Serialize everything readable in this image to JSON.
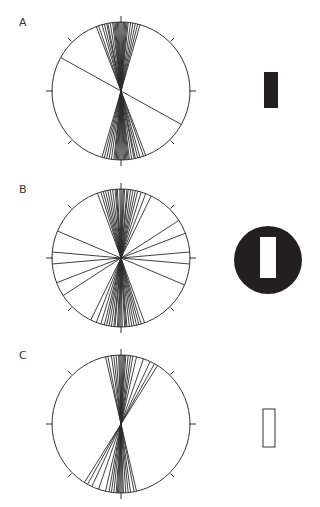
{
  "panels": [
    {
      "id": "A",
      "label": "A",
      "label_pos": [
        19,
        16
      ],
      "circle": {
        "cx": 121,
        "cy": 91,
        "r": 69
      },
      "line_angles_deg": [
        -21,
        -19,
        -16,
        -14,
        -12,
        -11,
        -9,
        -7,
        -6,
        -5,
        -4,
        -3,
        -2,
        -1,
        0,
        1,
        2,
        3,
        4,
        5,
        6,
        8,
        10,
        12,
        14,
        16,
        -61
      ],
      "shape": {
        "type": "filled-rect",
        "x": 264,
        "y": 72,
        "w": 14,
        "h": 36,
        "fill": "#231f20"
      }
    },
    {
      "id": "B",
      "label": "B",
      "label_pos": [
        19,
        183
      ],
      "circle": {
        "cx": 121,
        "cy": 258,
        "r": 69
      },
      "line_angles_deg": [
        -20,
        -17,
        -15,
        -13,
        -11,
        -9,
        -7,
        -5,
        -4,
        -3,
        -1,
        0,
        1,
        2,
        3,
        5,
        6,
        8,
        10,
        12,
        14,
        17,
        21,
        26,
        57,
        69,
        85,
        95,
        113
      ],
      "shape": {
        "type": "disk-with-slot",
        "cx": 268,
        "cy": 260,
        "r": 34,
        "slot": {
          "x": 260,
          "y": 237,
          "w": 16,
          "h": 41
        },
        "fill": "#231f20"
      }
    },
    {
      "id": "C",
      "label": "C",
      "label_pos": [
        19,
        349
      ],
      "circle": {
        "cx": 121,
        "cy": 424,
        "r": 69
      },
      "line_angles_deg": [
        -13,
        -11,
        -8,
        -6,
        -4,
        -2,
        -1,
        0,
        1,
        2,
        3,
        4,
        6,
        8,
        10,
        13,
        19,
        25,
        29,
        32
      ],
      "shape": {
        "type": "outline-rect",
        "x": 263,
        "y": 409,
        "w": 12,
        "h": 38,
        "stroke": "#555555"
      }
    }
  ],
  "style": {
    "line_color": "#2b2b2b",
    "circle_color": "#333333",
    "tick_length": 6
  }
}
